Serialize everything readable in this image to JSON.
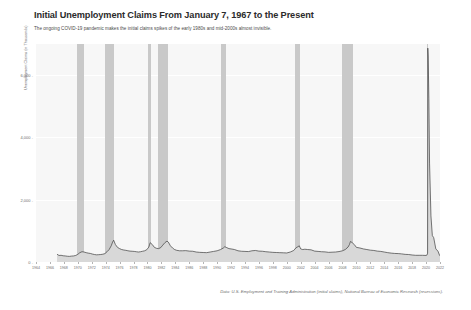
{
  "header": {
    "title": "Initial Unemployment Claims From January 7, 1967 to the Present",
    "subtitle": "The ongoing COVID-19 pandemic makes the initial claims spikes of the early 1980s and mid-2000s almost invisible."
  },
  "footer": {
    "source": "Data: U.S. Employment and Training Administration (initial claims), National Bureau of Economic Research (recessions)."
  },
  "colors": {
    "plot_background": "#f7f7f7",
    "gridline": "#ffffff",
    "recession_band": "#c9c9c9",
    "series_line": "#3d3d3d",
    "series_fill": "#d8d8d8",
    "title_text": "#2b2b2b",
    "axis_text": "#6d6d6d"
  },
  "chart_data": {
    "type": "area",
    "title": "Initial Unemployment Claims From January 7, 1967 to the Present",
    "subtitle": "The ongoing COVID-19 pandemic makes the initial claims spikes of the early 1980s and mid-2000s almost invisible.",
    "xlabel": "",
    "ylabel": "Unemployment Claims (in Thousands)",
    "xlim": [
      1964,
      2022
    ],
    "ylim": [
      0,
      7000
    ],
    "grid": true,
    "legend": "none",
    "y_ticks": [
      {
        "value": 0,
        "label": "0"
      },
      {
        "value": 2000,
        "label": "2,000"
      },
      {
        "value": 4000,
        "label": "4,000"
      },
      {
        "value": 6000,
        "label": "6,000"
      }
    ],
    "x_ticks": [
      1964,
      1966,
      1968,
      1970,
      1972,
      1974,
      1976,
      1978,
      1980,
      1982,
      1984,
      1986,
      1988,
      1990,
      1992,
      1994,
      1996,
      1998,
      2000,
      2002,
      2004,
      2006,
      2008,
      2010,
      2012,
      2014,
      2016,
      2018,
      2020,
      2022
    ],
    "recession_bands": [
      {
        "start": 1969.92,
        "end": 1970.92,
        "label": "1969-1970 recession"
      },
      {
        "start": 1973.92,
        "end": 1975.25,
        "label": "1973-1975 recession"
      },
      {
        "start": 1980.08,
        "end": 1980.58,
        "label": "1980 recession"
      },
      {
        "start": 1981.58,
        "end": 1982.92,
        "label": "1981-1982 recession"
      },
      {
        "start": 1990.58,
        "end": 1991.25,
        "label": "1990-1991 recession"
      },
      {
        "start": 2001.25,
        "end": 2001.92,
        "label": "2001 recession"
      },
      {
        "start": 2007.92,
        "end": 2009.5,
        "label": "2007-2009 Great Recession"
      },
      {
        "start": 2020.08,
        "end": 2020.33,
        "label": "2020 COVID-19 recession"
      }
    ],
    "series": [
      {
        "name": "Initial claims (weekly, thousands)",
        "x": [
          1967.02,
          1967.3,
          1967.6,
          1967.9,
          1968.2,
          1968.5,
          1968.8,
          1969.1,
          1969.4,
          1969.7,
          1970.0,
          1970.3,
          1970.6,
          1970.9,
          1971.2,
          1971.5,
          1971.8,
          1972.1,
          1972.4,
          1972.7,
          1973.0,
          1973.3,
          1973.6,
          1973.9,
          1974.2,
          1974.5,
          1974.8,
          1975.0,
          1975.15,
          1975.4,
          1975.7,
          1976.0,
          1976.3,
          1976.6,
          1976.9,
          1977.2,
          1977.5,
          1977.8,
          1978.1,
          1978.4,
          1978.7,
          1979.0,
          1979.3,
          1979.6,
          1979.9,
          1980.2,
          1980.4,
          1980.7,
          1981.0,
          1981.3,
          1981.6,
          1981.9,
          1982.2,
          1982.5,
          1982.8,
          1983.0,
          1983.3,
          1983.6,
          1983.9,
          1984.2,
          1984.6,
          1985.0,
          1985.5,
          1986.0,
          1986.5,
          1987.0,
          1987.5,
          1988.0,
          1988.5,
          1989.0,
          1989.5,
          1990.0,
          1990.5,
          1990.9,
          1991.1,
          1991.4,
          1991.7,
          1992.0,
          1992.5,
          1993.0,
          1993.5,
          1994.0,
          1994.5,
          1995.0,
          1995.5,
          1996.0,
          1996.5,
          1997.0,
          1997.5,
          1998.0,
          1998.5,
          1999.0,
          1999.5,
          2000.0,
          2000.5,
          2001.0,
          2001.3,
          2001.6,
          2001.8,
          2002.0,
          2002.3,
          2002.6,
          2003.0,
          2003.5,
          2004.0,
          2004.5,
          2005.0,
          2005.5,
          2006.0,
          2006.5,
          2007.0,
          2007.5,
          2008.0,
          2008.4,
          2008.8,
          2009.0,
          2009.15,
          2009.4,
          2009.7,
          2010.0,
          2010.5,
          2011.0,
          2011.5,
          2012.0,
          2012.5,
          2013.0,
          2013.5,
          2014.0,
          2014.5,
          2015.0,
          2015.5,
          2016.0,
          2016.5,
          2017.0,
          2017.5,
          2018.0,
          2018.5,
          2019.0,
          2019.5,
          2020.0,
          2020.12,
          2020.22,
          2020.25,
          2020.3,
          2020.4,
          2020.5,
          2020.7,
          2020.9,
          2021.1,
          2021.4,
          2021.7,
          2021.95,
          2022.1
        ],
        "y": [
          250,
          210,
          215,
          200,
          195,
          185,
          180,
          190,
          195,
          210,
          245,
          300,
          330,
          320,
          300,
          285,
          275,
          255,
          240,
          230,
          235,
          240,
          250,
          270,
          330,
          400,
          520,
          640,
          700,
          560,
          470,
          430,
          400,
          385,
          375,
          360,
          350,
          345,
          340,
          330,
          320,
          330,
          345,
          360,
          395,
          480,
          620,
          560,
          470,
          440,
          430,
          460,
          540,
          620,
          670,
          640,
          520,
          450,
          400,
          375,
          360,
          360,
          365,
          350,
          345,
          320,
          310,
          305,
          300,
          320,
          340,
          360,
          400,
          450,
          490,
          460,
          430,
          420,
          400,
          360,
          345,
          340,
          335,
          360,
          370,
          350,
          345,
          330,
          320,
          310,
          305,
          300,
          295,
          290,
          320,
          370,
          450,
          490,
          520,
          420,
          400,
          410,
          400,
          390,
          350,
          340,
          330,
          325,
          310,
          315,
          320,
          335,
          360,
          400,
          480,
          560,
          660,
          620,
          560,
          470,
          450,
          420,
          400,
          380,
          370,
          350,
          340,
          320,
          300,
          285,
          275,
          270,
          260,
          245,
          240,
          225,
          215,
          215,
          215,
          210,
          220,
          282,
          6867,
          6615,
          5237,
          3176,
          1480,
          850,
          780,
          420,
          350,
          210,
          230
        ]
      }
    ],
    "annotations": [
      {
        "text": "COVID-19 spike peak",
        "x": 2020.25,
        "y": 6867
      }
    ]
  }
}
